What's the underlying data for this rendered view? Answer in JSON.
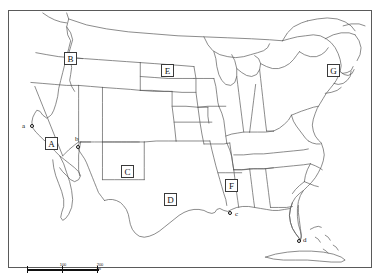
{
  "figure": {
    "kind": "reference-map",
    "background_color": "#ffffff",
    "line_color": "#4a4a4a",
    "label_text_color": "#111111",
    "header_fragment": ""
  },
  "region_labels": [
    {
      "id": "A",
      "label": "A",
      "x": 36,
      "y": 126,
      "area": "california"
    },
    {
      "id": "B",
      "label": "B",
      "x": 55,
      "y": 41,
      "area": "washington-idaho"
    },
    {
      "id": "C",
      "label": "C",
      "x": 112,
      "y": 154,
      "area": "new-mexico"
    },
    {
      "id": "D",
      "label": "D",
      "x": 155,
      "y": 182,
      "area": "texas"
    },
    {
      "id": "E",
      "label": "E",
      "x": 152,
      "y": 53,
      "area": "south-dakota"
    },
    {
      "id": "F",
      "label": "F",
      "x": 216,
      "y": 168,
      "area": "mississippi"
    },
    {
      "id": "G",
      "label": "G",
      "x": 318,
      "y": 53,
      "area": "new-england"
    }
  ],
  "city_points": [
    {
      "id": "a",
      "label": "a",
      "dot_x": 21,
      "dot_y": 113,
      "text_x": 13,
      "text_y": 112
    },
    {
      "id": "b",
      "label": "b",
      "dot_x": 67,
      "dot_y": 134,
      "text_x": 66,
      "text_y": 125
    },
    {
      "id": "c",
      "label": "c",
      "dot_x": 219,
      "dot_y": 200,
      "text_x": 226,
      "text_y": 200
    },
    {
      "id": "d",
      "label": "d",
      "dot_x": 288,
      "dot_y": 228,
      "text_x": 294,
      "text_y": 226
    }
  ],
  "scale_bar": {
    "left_label": "0",
    "mid_label": "100",
    "right_label": "200 mi",
    "mid_fraction": 0.5
  }
}
